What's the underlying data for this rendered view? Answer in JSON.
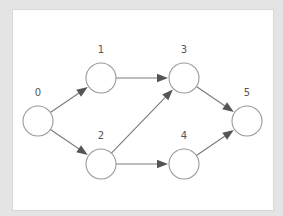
{
  "diagram": {
    "type": "directed-graph",
    "colors": {
      "background": "#e4e4e4",
      "panel": "#ffffff",
      "node_stroke": "#999999",
      "edge": "#7a7a7a",
      "arrowhead": "#555555",
      "label": "#555555"
    },
    "node_radius": 15,
    "nodes": [
      {
        "id": "0",
        "label": "0",
        "x": 38,
        "y": 121
      },
      {
        "id": "1",
        "label": "1",
        "x": 101,
        "y": 78
      },
      {
        "id": "2",
        "label": "2",
        "x": 101,
        "y": 164
      },
      {
        "id": "3",
        "label": "3",
        "x": 184,
        "y": 78
      },
      {
        "id": "4",
        "label": "4",
        "x": 184,
        "y": 164
      },
      {
        "id": "5",
        "label": "5",
        "x": 247,
        "y": 121
      }
    ],
    "edges": [
      {
        "from": "0",
        "to": "1"
      },
      {
        "from": "0",
        "to": "2"
      },
      {
        "from": "1",
        "to": "3"
      },
      {
        "from": "2",
        "to": "3"
      },
      {
        "from": "2",
        "to": "4"
      },
      {
        "from": "3",
        "to": "5"
      },
      {
        "from": "4",
        "to": "5"
      }
    ]
  }
}
